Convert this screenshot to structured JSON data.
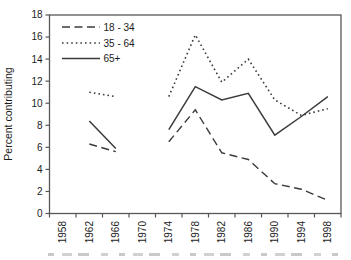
{
  "figure": {
    "background": "#ffffff",
    "plot_border_color": "#575757",
    "line_color": "#3b3b3b",
    "text_color": "#1c1c1c"
  },
  "chart_data": {
    "type": "line",
    "title": "",
    "xlabel": "",
    "ylabel": "Percent contributing",
    "ylim": [
      0,
      18
    ],
    "yticks": [
      0,
      2,
      4,
      6,
      8,
      10,
      12,
      14,
      16,
      18
    ],
    "categories": [
      "1958",
      "1962",
      "1966",
      "1970",
      "1974",
      "1978",
      "1982",
      "1986",
      "1990",
      "1994",
      "1998"
    ],
    "grid": false,
    "legend_position": "top-left-inside",
    "series": [
      {
        "name": "18 - 34",
        "style": "dashed",
        "values": [
          null,
          6.3,
          5.6,
          null,
          6.5,
          9.4,
          5.5,
          4.9,
          2.7,
          2.2,
          1.2
        ]
      },
      {
        "name": "35 - 64",
        "style": "dotted",
        "values": [
          null,
          11.0,
          10.6,
          null,
          10.6,
          16.2,
          11.9,
          14.0,
          10.3,
          8.9,
          9.5
        ]
      },
      {
        "name": "65+",
        "style": "solid",
        "values": [
          null,
          8.4,
          5.9,
          null,
          7.6,
          11.5,
          10.3,
          10.9,
          7.1,
          8.8,
          10.6
        ]
      }
    ]
  }
}
